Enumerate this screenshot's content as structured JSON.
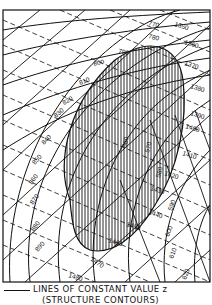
{
  "diagram": {
    "title": "",
    "dashed_contours_upper": [
      "770",
      "780",
      "790",
      "800",
      "810",
      "820",
      "830",
      "840",
      "850",
      "860",
      "870",
      "880",
      "890"
    ],
    "dashed_contours_right": [
      "1350",
      "1360",
      "1370",
      "1380",
      "1390",
      "1400",
      "1410",
      "1420",
      "1430",
      "1440",
      "1450",
      "1460",
      "1470",
      "1480"
    ],
    "rotated_contours": [
      "560",
      "570",
      "580",
      "590",
      "600",
      "610",
      "620"
    ],
    "hatched_region": "vertical-line shaded elliptical region",
    "colors": {
      "ink": "#111111",
      "background": "#ffffff"
    }
  },
  "legend": {
    "line_label": "LINES OF CONSTANT VALUE z",
    "line_sublabel": "(STRUCTURE CONTOURS)"
  }
}
